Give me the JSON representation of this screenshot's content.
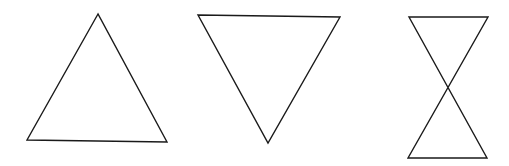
{
  "canvas": {
    "width": 509,
    "height": 166,
    "background": "#ffffff"
  },
  "stroke": {
    "color": "#1a1a1a",
    "width": 1.4
  },
  "shapes": [
    {
      "name": "upward-triangle",
      "points": "98,14 27,140 167,142"
    },
    {
      "name": "downward-triangle",
      "points": "198,15 340,17 268,143"
    },
    {
      "name": "hourglass",
      "points": "409,17 488,17 408,158 487,158"
    }
  ]
}
